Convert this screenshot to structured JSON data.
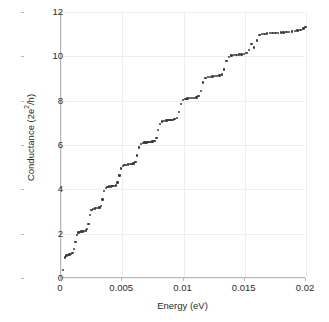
{
  "chart_data": {
    "type": "scatter",
    "title": "",
    "xlabel": "Energy (eV)",
    "ylabel_parts": {
      "prefix": "Conductance (2e",
      "superscript": "2",
      "suffix": "/h)"
    },
    "ylabel": "Conductance (2e2/h)",
    "xlim": [
      0,
      0.02
    ],
    "ylim": [
      0,
      12
    ],
    "xticks": [
      0,
      0.005,
      0.01,
      0.015,
      0.02
    ],
    "xticklabels": [
      "0",
      "0.005",
      "0.01",
      "0.015",
      "0.02"
    ],
    "yticks": [
      0,
      2,
      4,
      6,
      8,
      10,
      12
    ],
    "yticklabels": [
      "0",
      "2",
      "4",
      "6",
      "8",
      "10",
      "12"
    ],
    "grid": true,
    "legend": null,
    "marker": {
      "shape": "circle",
      "color": "#3b3b3b",
      "size_px": 2.4
    },
    "plateau_levels": [
      1,
      2,
      3,
      4,
      5,
      6,
      7,
      8,
      9,
      10,
      11
    ],
    "series": [
      {
        "name": "Conductance",
        "x": [
          0.00018,
          0.00032,
          0.00045,
          0.00058,
          0.0007,
          0.00082,
          0.00094,
          0.00106,
          0.00118,
          0.0013,
          0.00142,
          0.00154,
          0.00166,
          0.00178,
          0.0019,
          0.00202,
          0.00214,
          0.00226,
          0.00238,
          0.0025,
          0.00262,
          0.00275,
          0.00288,
          0.00301,
          0.00314,
          0.00327,
          0.0034,
          0.00353,
          0.00366,
          0.00379,
          0.00392,
          0.00406,
          0.0042,
          0.00434,
          0.00448,
          0.00462,
          0.00476,
          0.0049,
          0.00504,
          0.00518,
          0.00532,
          0.00547,
          0.00562,
          0.00577,
          0.00592,
          0.00607,
          0.00622,
          0.00637,
          0.00652,
          0.00667,
          0.00682,
          0.00698,
          0.00714,
          0.0073,
          0.00746,
          0.00762,
          0.00778,
          0.00794,
          0.0081,
          0.00826,
          0.00843,
          0.0086,
          0.00877,
          0.00894,
          0.00911,
          0.00928,
          0.00945,
          0.00962,
          0.00979,
          0.00997,
          0.01015,
          0.01033,
          0.01051,
          0.01069,
          0.01087,
          0.01105,
          0.01123,
          0.01141,
          0.0116,
          0.01179,
          0.01198,
          0.01217,
          0.01236,
          0.01255,
          0.01274,
          0.01293,
          0.01312,
          0.01332,
          0.01352,
          0.01372,
          0.01392,
          0.01412,
          0.01432,
          0.01452,
          0.01472,
          0.01493,
          0.01514,
          0.01535,
          0.01556,
          0.01577,
          0.01598,
          0.01619,
          0.0164,
          0.01662,
          0.01684,
          0.01706,
          0.01728,
          0.0175,
          0.01772,
          0.01794,
          0.01817,
          0.0184,
          0.01863,
          0.01886,
          0.01909,
          0.01932,
          0.01955,
          0.01978,
          0.01996
        ],
        "y": [
          0.35,
          0.92,
          1.02,
          1.05,
          1.06,
          1.07,
          1.12,
          1.3,
          1.62,
          1.95,
          2.05,
          2.08,
          2.09,
          2.1,
          2.12,
          2.14,
          2.22,
          2.45,
          2.85,
          3.08,
          3.12,
          3.14,
          3.15,
          3.16,
          3.18,
          3.26,
          3.55,
          3.92,
          4.06,
          4.1,
          4.12,
          4.13,
          4.14,
          4.16,
          4.18,
          4.3,
          4.62,
          4.94,
          5.06,
          5.09,
          5.11,
          5.12,
          5.13,
          5.14,
          5.16,
          5.24,
          5.52,
          5.88,
          6.05,
          6.09,
          6.11,
          6.12,
          6.13,
          6.14,
          6.16,
          6.18,
          6.32,
          6.68,
          6.96,
          7.06,
          7.09,
          7.11,
          7.12,
          7.13,
          7.14,
          7.16,
          7.22,
          7.48,
          7.86,
          8.04,
          8.08,
          8.1,
          8.11,
          8.12,
          8.13,
          8.15,
          8.2,
          8.44,
          8.82,
          9.02,
          9.06,
          9.08,
          9.09,
          9.1,
          9.11,
          9.13,
          9.18,
          9.4,
          9.78,
          9.98,
          10.04,
          10.06,
          10.07,
          10.08,
          10.09,
          10.11,
          10.14,
          10.28,
          10.55,
          10.4,
          10.72,
          10.95,
          11.0,
          11.02,
          11.03,
          11.04,
          11.05,
          11.05,
          11.06,
          11.07,
          11.08,
          11.09,
          11.1,
          11.12,
          11.14,
          11.16,
          11.2,
          11.26,
          11.32
        ]
      }
    ]
  }
}
